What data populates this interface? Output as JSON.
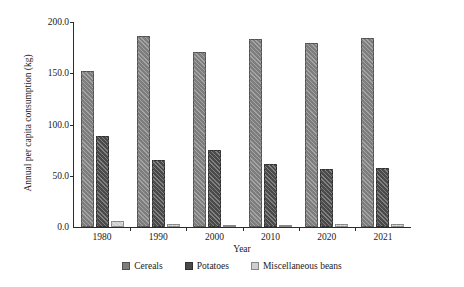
{
  "chart_data": {
    "type": "bar",
    "title": "",
    "xlabel": "Year",
    "ylabel": "Annual per capita consumption (kg)",
    "categories": [
      "1980",
      "1990",
      "2000",
      "2010",
      "2020",
      "2021"
    ],
    "series": [
      {
        "name": "Cereals",
        "color": "#7d7d7d",
        "values": [
          152.0,
          186.0,
          171.0,
          183.0,
          180.0,
          184.0
        ]
      },
      {
        "name": "Potatoes",
        "color": "#4a4a4a",
        "values": [
          89.0,
          65.0,
          75.0,
          61.0,
          57.0,
          58.0
        ]
      },
      {
        "name": "Miscellaneous beans",
        "color": "#cfcfcf",
        "values": [
          6.0,
          3.0,
          2.0,
          2.0,
          2.5,
          2.5
        ]
      }
    ],
    "ylim": [
      0.0,
      200.0
    ],
    "yticks": [
      "0.0",
      "50.0",
      "100.0",
      "150.0",
      "200.0"
    ],
    "ytick_values": [
      0,
      50,
      100,
      150,
      200
    ],
    "grid": false,
    "legend_position": "bottom"
  }
}
